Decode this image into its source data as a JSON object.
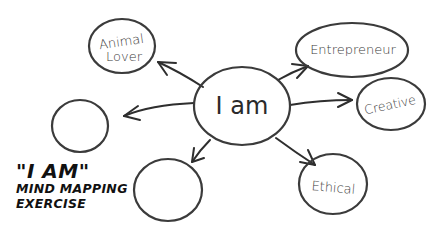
{
  "center": {
    "label": "I am"
  },
  "nodes": [
    {
      "id": "animal-lover",
      "line1": "Animal",
      "line2": "Lover"
    },
    {
      "id": "entrepreneur",
      "line1": "Entrepreneur"
    },
    {
      "id": "creative",
      "line1": "Creative"
    },
    {
      "id": "ethical",
      "line1": "Ethical"
    },
    {
      "id": "blank-left",
      "line1": ""
    },
    {
      "id": "blank-bottom",
      "line1": ""
    }
  ],
  "title": {
    "main": "\"I AM\"",
    "line2": "MIND MAPPING",
    "line3": "EXERCISE"
  },
  "colors": {
    "stroke": "#3a3a3a",
    "text": "#111111",
    "background": "#ffffff"
  }
}
